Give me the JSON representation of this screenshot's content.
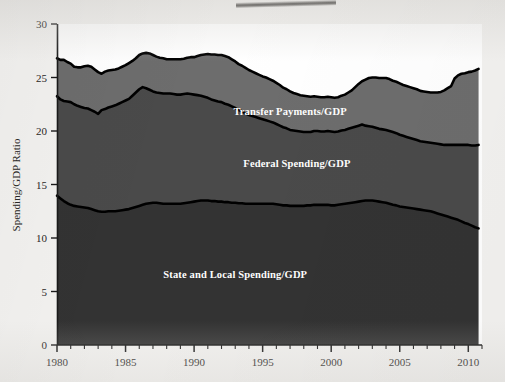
{
  "figure": {
    "background_color": "#f3f2f0",
    "plot_background_color": "#ffffff",
    "artifact_name": "scan-smudge"
  },
  "chart_data": {
    "type": "area",
    "stacked": true,
    "title": "",
    "subtitle": "",
    "xlabel": "",
    "ylabel": "Spending/GDP Ratio",
    "xlim": [
      1980,
      2011
    ],
    "ylim": [
      0,
      30
    ],
    "grid": false,
    "legend_position": "inline-annotations",
    "x_ticks": [
      "1980",
      "1985",
      "1990",
      "1995",
      "2000",
      "2005",
      "2010"
    ],
    "x_tick_values": [
      1980,
      1985,
      1990,
      1995,
      2000,
      2005,
      2010
    ],
    "x_minor_tick_interval": 1,
    "y_ticks": [
      "0",
      "5",
      "10",
      "15",
      "20",
      "25",
      "30"
    ],
    "y_tick_values": [
      0,
      5,
      10,
      15,
      20,
      25,
      30
    ],
    "colors": {
      "state_and_local": "#333333",
      "federal": "#4a4a4a",
      "transfer_payments": "#6d6d6d",
      "line": "#000000",
      "axis": "#1a1a1a",
      "label_text": "#ffffff"
    },
    "x": [
      1980.0,
      1980.25,
      1980.5,
      1980.75,
      1981.0,
      1981.25,
      1981.5,
      1981.75,
      1982.0,
      1982.25,
      1982.5,
      1982.75,
      1983.0,
      1983.25,
      1983.5,
      1983.75,
      1984.0,
      1984.25,
      1984.5,
      1984.75,
      1985.0,
      1985.25,
      1985.5,
      1985.75,
      1986.0,
      1986.25,
      1986.5,
      1986.75,
      1987.0,
      1987.25,
      1987.5,
      1987.75,
      1988.0,
      1988.25,
      1988.5,
      1988.75,
      1989.0,
      1989.25,
      1989.5,
      1989.75,
      1990.0,
      1990.25,
      1990.5,
      1990.75,
      1991.0,
      1991.25,
      1991.5,
      1991.75,
      1992.0,
      1992.25,
      1992.5,
      1992.75,
      1993.0,
      1993.25,
      1993.5,
      1993.75,
      1994.0,
      1994.25,
      1994.5,
      1994.75,
      1995.0,
      1995.25,
      1995.5,
      1995.75,
      1996.0,
      1996.25,
      1996.5,
      1996.75,
      1997.0,
      1997.25,
      1997.5,
      1997.75,
      1998.0,
      1998.25,
      1998.5,
      1998.75,
      1999.0,
      1999.25,
      1999.5,
      1999.75,
      2000.0,
      2000.25,
      2000.5,
      2000.75,
      2001.0,
      2001.25,
      2001.5,
      2001.75,
      2002.0,
      2002.25,
      2002.5,
      2002.75,
      2003.0,
      2003.25,
      2003.5,
      2003.75,
      2004.0,
      2004.25,
      2004.5,
      2004.75,
      2005.0,
      2005.25,
      2005.5,
      2005.75,
      2006.0,
      2006.25,
      2006.5,
      2006.75,
      2007.0,
      2007.25,
      2007.5,
      2007.75,
      2008.0,
      2008.25,
      2008.5,
      2008.75,
      2009.0,
      2009.25,
      2009.5,
      2009.75,
      2010.0,
      2010.25,
      2010.5,
      2010.75
    ],
    "series": [
      {
        "name": "State and Local Spending/GDP",
        "color": "#333333",
        "label_x": 1993.0,
        "label_y": 6.3,
        "values": [
          13.95,
          13.7,
          13.45,
          13.25,
          13.1,
          13.0,
          12.95,
          12.9,
          12.85,
          12.8,
          12.7,
          12.6,
          12.5,
          12.45,
          12.45,
          12.5,
          12.5,
          12.5,
          12.55,
          12.6,
          12.65,
          12.7,
          12.8,
          12.9,
          13.0,
          13.1,
          13.2,
          13.25,
          13.3,
          13.3,
          13.25,
          13.2,
          13.2,
          13.2,
          13.2,
          13.2,
          13.2,
          13.25,
          13.3,
          13.35,
          13.4,
          13.45,
          13.5,
          13.5,
          13.5,
          13.45,
          13.45,
          13.4,
          13.4,
          13.35,
          13.35,
          13.3,
          13.3,
          13.25,
          13.25,
          13.2,
          13.2,
          13.2,
          13.2,
          13.2,
          13.2,
          13.2,
          13.2,
          13.2,
          13.15,
          13.1,
          13.05,
          13.05,
          13.0,
          13.0,
          13.0,
          13.0,
          13.0,
          13.05,
          13.05,
          13.1,
          13.1,
          13.1,
          13.1,
          13.1,
          13.05,
          13.05,
          13.1,
          13.15,
          13.2,
          13.25,
          13.3,
          13.35,
          13.4,
          13.45,
          13.5,
          13.5,
          13.5,
          13.45,
          13.4,
          13.35,
          13.3,
          13.2,
          13.1,
          13.05,
          12.95,
          12.9,
          12.85,
          12.8,
          12.75,
          12.7,
          12.65,
          12.6,
          12.55,
          12.5,
          12.4,
          12.3,
          12.2,
          12.1,
          12.0,
          11.9,
          11.8,
          11.7,
          11.55,
          11.4,
          11.3,
          11.15,
          11.0,
          10.9
        ]
      },
      {
        "name": "Federal Spending/GDP",
        "color": "#4a4a4a",
        "label_x": 1997.5,
        "label_y": 16.6,
        "values": [
          9.3,
          9.25,
          9.35,
          9.5,
          9.6,
          9.5,
          9.4,
          9.35,
          9.3,
          9.3,
          9.25,
          9.2,
          9.1,
          9.5,
          9.6,
          9.7,
          9.8,
          9.9,
          10.0,
          10.1,
          10.2,
          10.3,
          10.5,
          10.7,
          10.9,
          11.0,
          10.8,
          10.6,
          10.4,
          10.3,
          10.3,
          10.3,
          10.3,
          10.3,
          10.25,
          10.2,
          10.2,
          10.2,
          10.2,
          10.1,
          10.0,
          9.9,
          9.8,
          9.7,
          9.6,
          9.5,
          9.4,
          9.35,
          9.3,
          9.2,
          9.1,
          9.0,
          8.85,
          8.7,
          8.6,
          8.45,
          8.3,
          8.2,
          8.1,
          8.0,
          7.9,
          7.8,
          7.7,
          7.6,
          7.5,
          7.4,
          7.3,
          7.2,
          7.1,
          7.05,
          7.0,
          6.95,
          6.9,
          6.85,
          6.85,
          6.9,
          6.9,
          6.85,
          6.85,
          6.9,
          6.9,
          6.85,
          6.85,
          6.9,
          6.9,
          6.95,
          7.0,
          7.05,
          7.1,
          7.15,
          7.0,
          6.95,
          6.9,
          6.85,
          6.8,
          6.8,
          6.8,
          6.8,
          6.8,
          6.75,
          6.7,
          6.65,
          6.6,
          6.55,
          6.5,
          6.45,
          6.4,
          6.4,
          6.4,
          6.4,
          6.45,
          6.5,
          6.55,
          6.6,
          6.7,
          6.8,
          6.9,
          7.0,
          7.15,
          7.3,
          7.4,
          7.5,
          7.65,
          7.8
        ]
      },
      {
        "name": "Transfer Payments/GDP",
        "color": "#6d6d6d",
        "label_x": 1997.0,
        "label_y": 21.5,
        "values": [
          3.55,
          3.7,
          3.85,
          3.7,
          3.6,
          3.5,
          3.6,
          3.7,
          3.9,
          4.0,
          4.05,
          3.95,
          3.9,
          3.4,
          3.5,
          3.45,
          3.4,
          3.35,
          3.3,
          3.3,
          3.3,
          3.35,
          3.25,
          3.2,
          3.2,
          3.15,
          3.3,
          3.4,
          3.4,
          3.35,
          3.3,
          3.3,
          3.2,
          3.2,
          3.25,
          3.3,
          3.3,
          3.3,
          3.35,
          3.45,
          3.5,
          3.65,
          3.8,
          3.95,
          4.1,
          4.2,
          4.3,
          4.35,
          4.4,
          4.45,
          4.45,
          4.4,
          4.35,
          4.3,
          4.25,
          4.25,
          4.2,
          4.15,
          4.1,
          4.05,
          4.0,
          4.0,
          3.95,
          3.9,
          3.85,
          3.8,
          3.7,
          3.65,
          3.6,
          3.5,
          3.45,
          3.4,
          3.4,
          3.35,
          3.3,
          3.25,
          3.2,
          3.2,
          3.2,
          3.2,
          3.2,
          3.2,
          3.2,
          3.25,
          3.3,
          3.4,
          3.5,
          3.7,
          3.9,
          4.05,
          4.3,
          4.5,
          4.6,
          4.7,
          4.75,
          4.8,
          4.85,
          4.85,
          4.8,
          4.8,
          4.8,
          4.75,
          4.75,
          4.75,
          4.75,
          4.75,
          4.7,
          4.7,
          4.7,
          4.7,
          4.75,
          4.8,
          4.9,
          5.1,
          5.3,
          5.5,
          6.2,
          6.5,
          6.65,
          6.7,
          6.8,
          6.9,
          7.0,
          7.1
        ]
      }
    ],
    "totals_note": "Top boundary equals the sum of all three stacked series (total spending/GDP), ranging roughly 23.2-27.2 percent."
  },
  "annotations": {
    "state_and_local_label": "State and Local Spending/GDP",
    "federal_label": "Federal Spending/GDP",
    "transfer_label": "Transfer Payments/GDP"
  },
  "axis": {
    "y_title": "Spending/GDP Ratio"
  }
}
